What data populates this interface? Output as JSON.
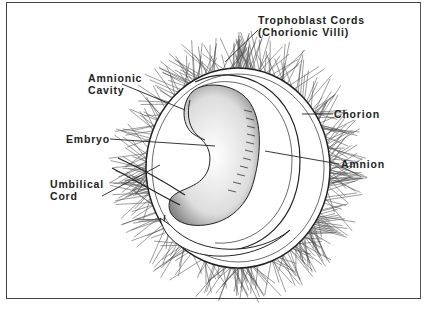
{
  "diagram": {
    "labels": {
      "trophoblast_line1": "Trophoblast Cords",
      "trophoblast_line2": "(Chorionic Villi)",
      "amnionic_line1": "Amnionic",
      "amnionic_line2": "Cavity",
      "chorion": "Chorion",
      "embryo": "Embryo",
      "amnion": "Amnion",
      "umbilical_line1": "Umbilical",
      "umbilical_line2": "Cord"
    },
    "colors": {
      "ink": "#222222",
      "frame": "#444444",
      "background": "#ffffff"
    }
  }
}
